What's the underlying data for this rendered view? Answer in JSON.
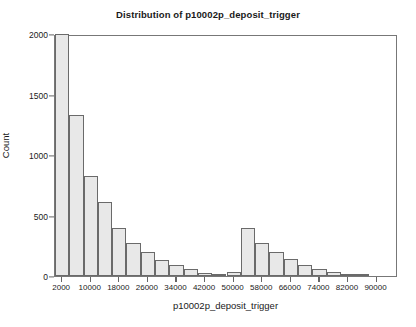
{
  "chart_data": {
    "type": "bar",
    "title": "Distribution of p10002p_deposit_trigger",
    "subtitle": "",
    "xlabel": "p10002p_deposit_trigger",
    "ylabel": "Count",
    "grid": false,
    "legend": null,
    "xlim": [
      0,
      96000
    ],
    "ylim": [
      0,
      2000
    ],
    "bin_width": 4000,
    "x_ticks": [
      2000,
      10000,
      18000,
      26000,
      34000,
      42000,
      50000,
      58000,
      66000,
      74000,
      82000,
      90000
    ],
    "x_tick_labels": [
      "2000",
      "10000",
      "18000",
      "26000",
      "34000",
      "42000",
      "50000",
      "58000",
      "66000",
      "74000",
      "82000",
      "90000"
    ],
    "y_ticks": [
      0,
      500,
      1000,
      1500,
      2000
    ],
    "y_tick_labels": [
      "0",
      "500",
      "1000",
      "1500",
      "2000"
    ],
    "bin_edges": [
      0,
      4000,
      8000,
      12000,
      16000,
      20000,
      24000,
      28000,
      32000,
      36000,
      40000,
      44000,
      48000,
      52000,
      56000,
      60000,
      64000,
      68000,
      72000,
      76000,
      80000,
      84000,
      88000,
      92000,
      96000
    ],
    "bin_centers": [
      2000,
      6000,
      10000,
      14000,
      18000,
      22000,
      26000,
      30000,
      34000,
      38000,
      42000,
      46000,
      50000,
      54000,
      58000,
      62000,
      66000,
      70000,
      74000,
      78000,
      82000,
      86000,
      90000,
      94000
    ],
    "values": [
      2000,
      1330,
      830,
      610,
      395,
      275,
      195,
      135,
      90,
      62,
      25,
      10,
      35,
      395,
      275,
      195,
      140,
      90,
      62,
      30,
      4,
      2,
      0,
      0
    ],
    "bar_fill_color": "#e8e8e8",
    "bar_edge_color": "#6a6a6a",
    "axis_color": "#777777",
    "text_color": "#1a1a1a",
    "background_color": "#ffffff"
  }
}
